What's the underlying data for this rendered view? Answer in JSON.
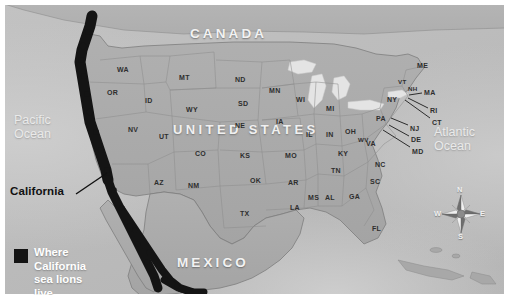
{
  "figure": {
    "kind": "thematic-map",
    "plate_background": "#b9b9b9",
    "range_band_color": "#141414"
  },
  "countries": [
    {
      "name": "CANADA",
      "x": 186,
      "y": 22
    },
    {
      "name": "MEXICO",
      "x": 173,
      "y": 251
    }
  ],
  "united_states_label": {
    "text": "UNITED STATES",
    "x": 169,
    "y": 118
  },
  "oceans": [
    {
      "name": "Pacific\nOcean",
      "x": 10,
      "y": 110
    },
    {
      "name": "Atlantic\nOcean",
      "x": 430,
      "y": 122
    }
  ],
  "callout": {
    "label": "California",
    "x": 6,
    "y": 181,
    "leader": {
      "x1": 72,
      "y1": 190,
      "x2": 103,
      "y2": 169
    }
  },
  "legend": {
    "swatch_color": "#141414",
    "line1": "Where California",
    "line2": "sea lions live"
  },
  "compass": {
    "north": "N",
    "east": "E",
    "south": "S",
    "west": "W"
  },
  "states": [
    {
      "abbr": "WA",
      "x": 113,
      "y": 62,
      "size": "n"
    },
    {
      "abbr": "OR",
      "x": 103,
      "y": 85,
      "size": "n"
    },
    {
      "abbr": "ID",
      "x": 141,
      "y": 93,
      "size": "n"
    },
    {
      "abbr": "MT",
      "x": 175,
      "y": 70,
      "size": "n"
    },
    {
      "abbr": "WY",
      "x": 182,
      "y": 102,
      "size": "n"
    },
    {
      "abbr": "NV",
      "x": 124,
      "y": 122,
      "size": "n"
    },
    {
      "abbr": "UT",
      "x": 155,
      "y": 129,
      "size": "n"
    },
    {
      "abbr": "CO",
      "x": 191,
      "y": 146,
      "size": "n"
    },
    {
      "abbr": "AZ",
      "x": 150,
      "y": 175,
      "size": "n"
    },
    {
      "abbr": "NM",
      "x": 184,
      "y": 178,
      "size": "n"
    },
    {
      "abbr": "ND",
      "x": 231,
      "y": 72,
      "size": "n"
    },
    {
      "abbr": "SD",
      "x": 234,
      "y": 96,
      "size": "n"
    },
    {
      "abbr": "NE",
      "x": 231,
      "y": 118,
      "size": "n"
    },
    {
      "abbr": "KS",
      "x": 236,
      "y": 148,
      "size": "n"
    },
    {
      "abbr": "OK",
      "x": 246,
      "y": 173,
      "size": "n"
    },
    {
      "abbr": "TX",
      "x": 236,
      "y": 206,
      "size": "n"
    },
    {
      "abbr": "MN",
      "x": 265,
      "y": 83,
      "size": "n"
    },
    {
      "abbr": "IA",
      "x": 272,
      "y": 114,
      "size": "n"
    },
    {
      "abbr": "MO",
      "x": 281,
      "y": 148,
      "size": "n"
    },
    {
      "abbr": "AR",
      "x": 284,
      "y": 175,
      "size": "n"
    },
    {
      "abbr": "LA",
      "x": 286,
      "y": 200,
      "size": "n"
    },
    {
      "abbr": "WI",
      "x": 292,
      "y": 92,
      "size": "n"
    },
    {
      "abbr": "IL",
      "x": 302,
      "y": 127,
      "size": "n"
    },
    {
      "abbr": "MI",
      "x": 322,
      "y": 101,
      "size": "n"
    },
    {
      "abbr": "IN",
      "x": 322,
      "y": 127,
      "size": "n"
    },
    {
      "abbr": "OH",
      "x": 341,
      "y": 124,
      "size": "n"
    },
    {
      "abbr": "KY",
      "x": 334,
      "y": 146,
      "size": "n"
    },
    {
      "abbr": "TN",
      "x": 327,
      "y": 163,
      "size": "n"
    },
    {
      "abbr": "MS",
      "x": 304,
      "y": 190,
      "size": "n"
    },
    {
      "abbr": "AL",
      "x": 321,
      "y": 190,
      "size": "n"
    },
    {
      "abbr": "GA",
      "x": 345,
      "y": 189,
      "size": "n"
    },
    {
      "abbr": "FL",
      "x": 368,
      "y": 221,
      "size": "n"
    },
    {
      "abbr": "SC",
      "x": 366,
      "y": 174,
      "size": "n"
    },
    {
      "abbr": "NC",
      "x": 371,
      "y": 157,
      "size": "n"
    },
    {
      "abbr": "VA",
      "x": 362,
      "y": 136,
      "size": "n"
    },
    {
      "abbr": "WV",
      "x": 354,
      "y": 132,
      "size": "sm"
    },
    {
      "abbr": "PA",
      "x": 372,
      "y": 111,
      "size": "n"
    },
    {
      "abbr": "NY",
      "x": 383,
      "y": 92,
      "size": "n"
    },
    {
      "abbr": "ME",
      "x": 413,
      "y": 58,
      "size": "n"
    },
    {
      "abbr": "VT",
      "x": 394,
      "y": 74,
      "size": "sm"
    },
    {
      "abbr": "NH",
      "x": 404,
      "y": 81,
      "size": "sm"
    }
  ],
  "leader_states": [
    {
      "abbr": "MA",
      "x": 420,
      "y": 85,
      "x1": 418,
      "y1": 89,
      "x2": 405,
      "y2": 91
    },
    {
      "abbr": "RI",
      "x": 426,
      "y": 103,
      "x1": 424,
      "y1": 104,
      "x2": 404,
      "y2": 94
    },
    {
      "abbr": "CT",
      "x": 428,
      "y": 115,
      "x1": 426,
      "y1": 114,
      "x2": 401,
      "y2": 96
    },
    {
      "abbr": "NJ",
      "x": 406,
      "y": 121,
      "x1": 404,
      "y1": 121,
      "x2": 387,
      "y2": 114
    },
    {
      "abbr": "DE",
      "x": 407,
      "y": 132,
      "x1": 405,
      "y1": 132,
      "x2": 385,
      "y2": 121
    },
    {
      "abbr": "MD",
      "x": 408,
      "y": 144,
      "x1": 406,
      "y1": 143,
      "x2": 379,
      "y2": 126
    }
  ]
}
